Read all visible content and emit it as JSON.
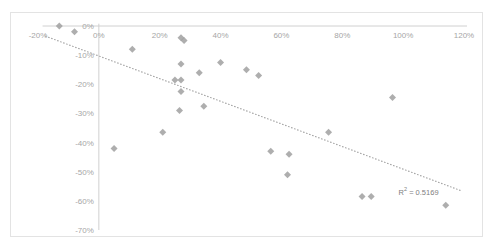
{
  "chart_data": {
    "type": "scatter",
    "title": "",
    "subtitle": "",
    "xlabel": "",
    "ylabel": "",
    "xlim": [
      -0.2,
      1.2
    ],
    "ylim": [
      -0.7,
      0.0
    ],
    "x_tick_labels": [
      "-20%",
      "0%",
      "20%",
      "40%",
      "60%",
      "80%",
      "100%",
      "120%"
    ],
    "x_tick_values": [
      -0.2,
      0.0,
      0.2,
      0.4,
      0.6,
      0.8,
      1.0,
      1.2
    ],
    "y_tick_labels": [
      "0%",
      "-10%",
      "-20%",
      "-30%",
      "-40%",
      "-50%",
      "-60%",
      "-70%"
    ],
    "y_tick_values": [
      0.0,
      -0.1,
      -0.2,
      -0.3,
      -0.4,
      -0.5,
      -0.6,
      -0.7
    ],
    "grid": false,
    "legend": false,
    "legend_position": "none",
    "marker": {
      "shape": "diamond",
      "color": "#a0a0a0",
      "size": 7
    },
    "series": [
      {
        "name": "Series 1",
        "points": [
          {
            "x": -0.13,
            "y": 0.0
          },
          {
            "x": -0.08,
            "y": -0.02
          },
          {
            "x": 0.11,
            "y": -0.08
          },
          {
            "x": 0.27,
            "y": -0.04
          },
          {
            "x": 0.28,
            "y": -0.05
          },
          {
            "x": 0.27,
            "y": -0.13
          },
          {
            "x": 0.25,
            "y": -0.185
          },
          {
            "x": 0.27,
            "y": -0.185
          },
          {
            "x": 0.27,
            "y": -0.225
          },
          {
            "x": 0.265,
            "y": -0.29
          },
          {
            "x": 0.21,
            "y": -0.365
          },
          {
            "x": 0.33,
            "y": -0.16
          },
          {
            "x": 0.345,
            "y": -0.275
          },
          {
            "x": 0.4,
            "y": -0.125
          },
          {
            "x": 0.485,
            "y": -0.15
          },
          {
            "x": 0.525,
            "y": -0.17
          },
          {
            "x": 0.05,
            "y": -0.42
          },
          {
            "x": 0.565,
            "y": -0.43
          },
          {
            "x": 0.625,
            "y": -0.44
          },
          {
            "x": 0.62,
            "y": -0.51
          },
          {
            "x": 0.755,
            "y": -0.365
          },
          {
            "x": 0.865,
            "y": -0.585
          },
          {
            "x": 0.895,
            "y": -0.585
          },
          {
            "x": 0.965,
            "y": -0.245
          },
          {
            "x": 1.14,
            "y": -0.615
          }
        ]
      }
    ],
    "trendline": {
      "type": "linear",
      "style": "dotted",
      "color": "#a6a6a6",
      "r_squared": 0.5169,
      "r_squared_label": "R",
      "r_squared_superscript": "2",
      "r_squared_equals": " = 0.5169",
      "x_start": -0.175,
      "y_start": -0.035,
      "x_end": 1.19,
      "y_end": -0.565
    },
    "annotations": [
      {
        "name": "r-squared",
        "text": "R² = 0.5169",
        "x": 0.985,
        "y": -0.565
      }
    ],
    "axis_color": "#d0d0d0",
    "tick_label_color": "#a6a6a6",
    "border_color": "#e3e3e3",
    "background_color": "#ffffff"
  }
}
